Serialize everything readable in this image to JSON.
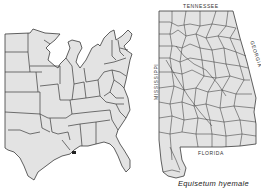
{
  "figure": {
    "caption": "Equisetum hyemale",
    "maps": [
      {
        "name": "eastern-united-states",
        "description": "Outline map of eastern and central United States with state boundaries; occurrence dot near southeastern Louisiana"
      },
      {
        "name": "alabama-counties",
        "description": "County outline map of Alabama",
        "border_labels": {
          "north": "TENNESSEE",
          "east": "GEORGIA",
          "west": "MISSISSIPPI",
          "south": "FLORIDA"
        }
      }
    ],
    "colors": {
      "land": "#e3e3e3",
      "lines": "#3a3a3a",
      "background": "#ffffff"
    }
  }
}
